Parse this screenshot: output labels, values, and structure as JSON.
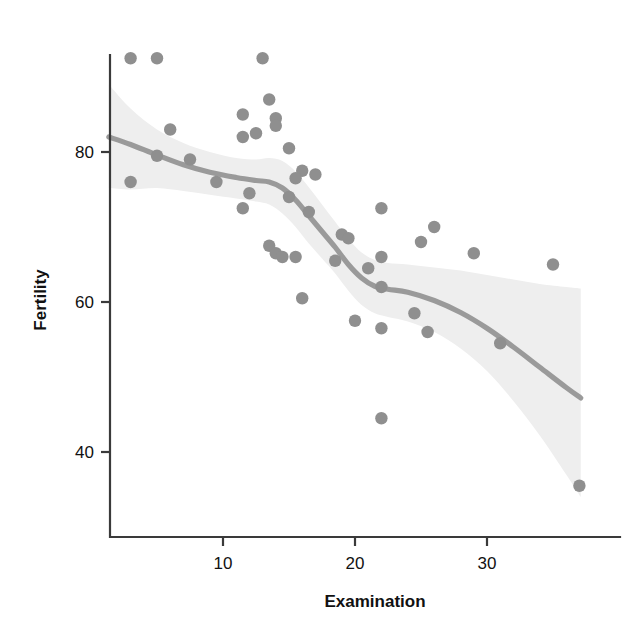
{
  "chart_data": {
    "type": "scatter",
    "title": "",
    "subtitle": "",
    "xlabel": "Examination",
    "ylabel": "Fertility",
    "xlim": [
      1.0,
      38.5
    ],
    "ylim": [
      32.0,
      95.0
    ],
    "xticks": [
      10,
      20,
      30
    ],
    "xtick_labels": [
      "10",
      "20",
      "30"
    ],
    "yticks": [
      40,
      60,
      80
    ],
    "ytick_labels": [
      "40",
      "60",
      "80"
    ],
    "grid": false,
    "legend": "none",
    "point_color": "#8f8f8f",
    "line_color": "#9a9a9a",
    "band_color": "#eeeeee",
    "axis_color": "#3a3a3a",
    "background": "#ffffff",
    "x": [
      3.0,
      5.0,
      13.0,
      13.5,
      11.5,
      14.0,
      14.0,
      6.0,
      12.5,
      11.5,
      15.0,
      5.0,
      7.5,
      3.0,
      16.0,
      9.5,
      15.5,
      17.0,
      12.0,
      15.0,
      11.5,
      22.0,
      16.5,
      19.0,
      19.5,
      13.5,
      14.0,
      14.5,
      15.5,
      18.5,
      21.0,
      22.0,
      25.0,
      26.0,
      22.0,
      29.0,
      24.5,
      20.0,
      22.0,
      25.5,
      31.0,
      35.0,
      16.0,
      22.0,
      37.0
    ],
    "y": [
      92.5,
      92.5,
      92.5,
      87.0,
      85.0,
      84.5,
      83.5,
      83.0,
      82.5,
      82.0,
      80.5,
      79.5,
      79.0,
      76.0,
      77.5,
      76.0,
      76.5,
      77.0,
      74.5,
      74.0,
      72.5,
      72.5,
      72.0,
      69.0,
      68.5,
      67.5,
      66.5,
      66.0,
      66.0,
      65.5,
      64.5,
      66.0,
      68.0,
      70.0,
      62.0,
      66.5,
      58.5,
      57.5,
      56.5,
      56.0,
      54.5,
      65.0,
      60.5,
      44.5,
      35.5
    ],
    "smoother": {
      "method": "loess",
      "points": [
        {
          "x": 1.35,
          "y": 82.0
        },
        {
          "x": 3.0,
          "y": 81.0
        },
        {
          "x": 5.0,
          "y": 79.6
        },
        {
          "x": 7.0,
          "y": 78.3
        },
        {
          "x": 9.0,
          "y": 77.3
        },
        {
          "x": 11.0,
          "y": 76.6
        },
        {
          "x": 12.5,
          "y": 76.2
        },
        {
          "x": 13.5,
          "y": 76.0
        },
        {
          "x": 14.5,
          "y": 75.2
        },
        {
          "x": 15.5,
          "y": 73.6
        },
        {
          "x": 16.5,
          "y": 71.5
        },
        {
          "x": 17.5,
          "y": 69.4
        },
        {
          "x": 18.5,
          "y": 67.3
        },
        {
          "x": 19.5,
          "y": 65.0
        },
        {
          "x": 20.5,
          "y": 63.2
        },
        {
          "x": 21.5,
          "y": 62.1
        },
        {
          "x": 22.5,
          "y": 61.7
        },
        {
          "x": 24.0,
          "y": 61.3
        },
        {
          "x": 26.0,
          "y": 60.2
        },
        {
          "x": 28.0,
          "y": 58.6
        },
        {
          "x": 30.0,
          "y": 56.5
        },
        {
          "x": 32.0,
          "y": 54.0
        },
        {
          "x": 34.0,
          "y": 51.3
        },
        {
          "x": 36.0,
          "y": 48.6
        },
        {
          "x": 37.1,
          "y": 47.2
        }
      ],
      "band_upper": [
        {
          "x": 1.35,
          "y": 89.0
        },
        {
          "x": 3.0,
          "y": 85.8
        },
        {
          "x": 5.0,
          "y": 83.0
        },
        {
          "x": 7.0,
          "y": 81.2
        },
        {
          "x": 9.0,
          "y": 80.0
        },
        {
          "x": 11.0,
          "y": 79.2
        },
        {
          "x": 12.5,
          "y": 79.0
        },
        {
          "x": 13.5,
          "y": 79.2
        },
        {
          "x": 14.5,
          "y": 78.8
        },
        {
          "x": 15.5,
          "y": 77.4
        },
        {
          "x": 16.5,
          "y": 75.3
        },
        {
          "x": 17.5,
          "y": 73.0
        },
        {
          "x": 18.5,
          "y": 70.7
        },
        {
          "x": 19.5,
          "y": 68.4
        },
        {
          "x": 20.5,
          "y": 66.6
        },
        {
          "x": 21.5,
          "y": 65.6
        },
        {
          "x": 22.5,
          "y": 65.2
        },
        {
          "x": 24.0,
          "y": 65.0
        },
        {
          "x": 26.0,
          "y": 64.6
        },
        {
          "x": 28.0,
          "y": 64.2
        },
        {
          "x": 30.0,
          "y": 63.6
        },
        {
          "x": 32.0,
          "y": 63.0
        },
        {
          "x": 34.0,
          "y": 62.4
        },
        {
          "x": 36.0,
          "y": 62.0
        },
        {
          "x": 37.1,
          "y": 61.8
        }
      ],
      "band_lower": [
        {
          "x": 1.35,
          "y": 75.2
        },
        {
          "x": 3.0,
          "y": 75.0
        },
        {
          "x": 5.0,
          "y": 75.2
        },
        {
          "x": 7.0,
          "y": 74.8
        },
        {
          "x": 9.0,
          "y": 74.3
        },
        {
          "x": 11.0,
          "y": 73.8
        },
        {
          "x": 12.5,
          "y": 73.4
        },
        {
          "x": 13.5,
          "y": 73.0
        },
        {
          "x": 14.5,
          "y": 71.8
        },
        {
          "x": 15.5,
          "y": 70.0
        },
        {
          "x": 16.5,
          "y": 67.8
        },
        {
          "x": 17.5,
          "y": 65.8
        },
        {
          "x": 18.5,
          "y": 63.8
        },
        {
          "x": 19.5,
          "y": 61.5
        },
        {
          "x": 20.5,
          "y": 59.6
        },
        {
          "x": 21.5,
          "y": 58.5
        },
        {
          "x": 22.5,
          "y": 58.0
        },
        {
          "x": 24.0,
          "y": 57.4
        },
        {
          "x": 26.0,
          "y": 56.0
        },
        {
          "x": 28.0,
          "y": 53.8
        },
        {
          "x": 30.0,
          "y": 50.8
        },
        {
          "x": 32.0,
          "y": 46.8
        },
        {
          "x": 34.0,
          "y": 42.2
        },
        {
          "x": 36.0,
          "y": 37.0
        },
        {
          "x": 37.1,
          "y": 34.0
        }
      ]
    }
  },
  "axes": {
    "x_axis_label": "Examination",
    "y_axis_label": "Fertility"
  }
}
